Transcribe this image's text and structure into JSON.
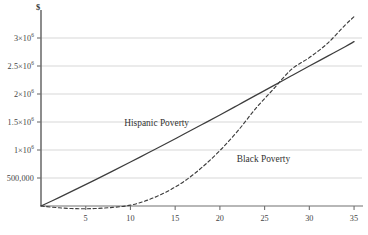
{
  "chart_data": {
    "type": "line",
    "title": "",
    "subtitle": "",
    "xlabel": "",
    "ylabel": "$",
    "ylabel_symbol": "$",
    "xlim": [
      0,
      36
    ],
    "ylim": [
      0,
      3500000
    ],
    "grid": true,
    "grid_axis": "y",
    "legend": "inline-annotations",
    "x_ticks": [
      5,
      10,
      15,
      20,
      25,
      30,
      35
    ],
    "x_tick_labels": [
      "5",
      "10",
      "15",
      "20",
      "25",
      "30",
      "35"
    ],
    "y_ticks": [
      500000,
      1000000,
      1500000,
      2000000,
      2500000,
      3000000
    ],
    "y_tick_labels": [
      "500,000",
      "1×10",
      "1.5×10",
      "2×10",
      "2.5×10",
      "3×10"
    ],
    "y_tick_exponents": [
      "",
      "6",
      "6",
      "6",
      "6",
      "6"
    ],
    "series": [
      {
        "name": "Hispanic Poverty",
        "style": "solid",
        "color": "#3d3d3d",
        "label_x": 14.0,
        "label_y": 1460000,
        "x": [
          0,
          2,
          4,
          6,
          8,
          10,
          12,
          14,
          16,
          18,
          20,
          22,
          24,
          26,
          28,
          30,
          32,
          34,
          35
        ],
        "values": [
          0,
          150000,
          305000,
          462000,
          622000,
          785000,
          950000,
          1115000,
          1285000,
          1455000,
          1625000,
          1800000,
          1975000,
          2150000,
          2325000,
          2500000,
          2672000,
          2845000,
          2935000
        ]
      },
      {
        "name": "Black Poverty",
        "style": "dashed",
        "color": "#3d3d3d",
        "label_x": 23.0,
        "label_y": 830000,
        "x": [
          0,
          2,
          4,
          6,
          8,
          10,
          12,
          14,
          16,
          18,
          20,
          22,
          24,
          26,
          28,
          30,
          32,
          34,
          35
        ],
        "values": [
          0,
          -32000,
          -48000,
          -45000,
          -25000,
          15000,
          110000,
          250000,
          440000,
          690000,
          990000,
          1340000,
          1740000,
          2090000,
          2440000,
          2650000,
          2900000,
          3230000,
          3380000
        ]
      }
    ]
  },
  "annotations": {
    "hispanic_label": "Hispanic Poverty",
    "black_label": "Black Poverty"
  }
}
